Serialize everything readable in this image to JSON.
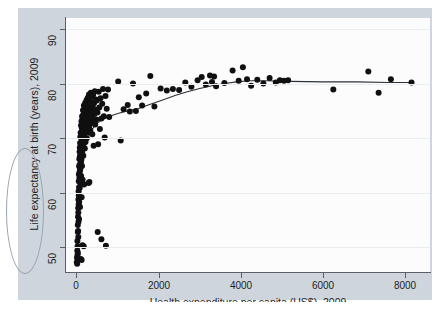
{
  "chart_data": {
    "type": "scatter",
    "title": "",
    "xlabel": "Health expenditure per capita (US$), 2009",
    "ylabel": "Life expectancy at birth (years), 2009",
    "xlim": [
      -250,
      8600
    ],
    "ylim": [
      45.5,
      92
    ],
    "xticks": [
      0,
      2000,
      4000,
      6000,
      8000
    ],
    "xtick_labels": [
      "0",
      "2000",
      "4000",
      "6000",
      "8000"
    ],
    "yticks": [
      50,
      60,
      70,
      80,
      90
    ],
    "ytick_labels": [
      "50",
      "60",
      "70",
      "80",
      "90"
    ],
    "grid": "horizontal",
    "legend": "none",
    "marker_color": "#101010",
    "marker_size": 4.2,
    "fit_line_color": "#2b3138",
    "fit_line_label": "lowess smoothed fit",
    "annotations": [
      {
        "name": "hand-drawn-oval",
        "target": "y-axis-label",
        "color": "#9aa3ad"
      }
    ],
    "points": [
      [
        12,
        47.3
      ],
      [
        18,
        48.1
      ],
      [
        22,
        47.0
      ],
      [
        25,
        49.4
      ],
      [
        28,
        51.2
      ],
      [
        30,
        48.6
      ],
      [
        33,
        50.2
      ],
      [
        36,
        52.8
      ],
      [
        38,
        54.1
      ],
      [
        40,
        49.0
      ],
      [
        42,
        55.6
      ],
      [
        44,
        53.0
      ],
      [
        46,
        57.2
      ],
      [
        48,
        51.9
      ],
      [
        50,
        56.4
      ],
      [
        52,
        58.8
      ],
      [
        54,
        54.7
      ],
      [
        56,
        60.3
      ],
      [
        58,
        57.9
      ],
      [
        60,
        62.1
      ],
      [
        62,
        59.5
      ],
      [
        64,
        63.4
      ],
      [
        66,
        55.2
      ],
      [
        68,
        61.0
      ],
      [
        70,
        64.8
      ],
      [
        72,
        58.3
      ],
      [
        74,
        66.2
      ],
      [
        76,
        62.7
      ],
      [
        78,
        65.1
      ],
      [
        80,
        67.5
      ],
      [
        82,
        60.9
      ],
      [
        84,
        63.9
      ],
      [
        86,
        68.3
      ],
      [
        88,
        66.7
      ],
      [
        90,
        57.4
      ],
      [
        92,
        69.1
      ],
      [
        95,
        64.3
      ],
      [
        98,
        70.2
      ],
      [
        100,
        61.8
      ],
      [
        103,
        67.9
      ],
      [
        106,
        71.0
      ],
      [
        109,
        65.6
      ],
      [
        112,
        68.8
      ],
      [
        115,
        72.3
      ],
      [
        118,
        63.1
      ],
      [
        121,
        70.6
      ],
      [
        124,
        66.1
      ],
      [
        127,
        73.1
      ],
      [
        130,
        59.2
      ],
      [
        133,
        69.7
      ],
      [
        136,
        71.8
      ],
      [
        139,
        64.9
      ],
      [
        142,
        74.0
      ],
      [
        145,
        67.2
      ],
      [
        148,
        72.6
      ],
      [
        151,
        70.9
      ],
      [
        154,
        62.4
      ],
      [
        157,
        73.6
      ],
      [
        160,
        68.5
      ],
      [
        163,
        75.1
      ],
      [
        166,
        71.3
      ],
      [
        170,
        66.8
      ],
      [
        174,
        74.3
      ],
      [
        178,
        69.9
      ],
      [
        182,
        72.9
      ],
      [
        186,
        76.0
      ],
      [
        190,
        61.5
      ],
      [
        194,
        73.9
      ],
      [
        198,
        70.4
      ],
      [
        202,
        75.4
      ],
      [
        206,
        68.1
      ],
      [
        210,
        74.6
      ],
      [
        215,
        72.1
      ],
      [
        220,
        76.5
      ],
      [
        225,
        69.3
      ],
      [
        230,
        73.3
      ],
      [
        235,
        75.8
      ],
      [
        240,
        71.6
      ],
      [
        245,
        74.9
      ],
      [
        250,
        77.0
      ],
      [
        255,
        70.0
      ],
      [
        260,
        73.7
      ],
      [
        265,
        76.2
      ],
      [
        270,
        72.4
      ],
      [
        275,
        75.0
      ],
      [
        280,
        77.4
      ],
      [
        285,
        71.1
      ],
      [
        290,
        74.1
      ],
      [
        295,
        76.8
      ],
      [
        300,
        73.0
      ],
      [
        305,
        75.5
      ],
      [
        310,
        78.0
      ],
      [
        315,
        72.2
      ],
      [
        320,
        74.5
      ],
      [
        325,
        77.2
      ],
      [
        330,
        73.5
      ],
      [
        335,
        75.9
      ],
      [
        340,
        71.4
      ],
      [
        345,
        76.6
      ],
      [
        350,
        74.2
      ],
      [
        355,
        78.3
      ],
      [
        360,
        72.8
      ],
      [
        365,
        75.3
      ],
      [
        370,
        77.6
      ],
      [
        375,
        73.8
      ],
      [
        380,
        76.1
      ],
      [
        385,
        74.8
      ],
      [
        390,
        70.7
      ],
      [
        400,
        75.7
      ],
      [
        410,
        77.9
      ],
      [
        420,
        73.2
      ],
      [
        430,
        76.4
      ],
      [
        440,
        74.4
      ],
      [
        450,
        78.6
      ],
      [
        460,
        72.5
      ],
      [
        470,
        75.2
      ],
      [
        480,
        77.1
      ],
      [
        490,
        73.4
      ],
      [
        500,
        76.9
      ],
      [
        515,
        74.7
      ],
      [
        530,
        68.9
      ],
      [
        545,
        78.5
      ],
      [
        560,
        75.6
      ],
      [
        575,
        71.7
      ],
      [
        590,
        77.3
      ],
      [
        610,
        73.6
      ],
      [
        630,
        76.3
      ],
      [
        650,
        79.0
      ],
      [
        670,
        74.0
      ],
      [
        690,
        70.1
      ],
      [
        710,
        77.7
      ],
      [
        740,
        75.4
      ],
      [
        770,
        78.9
      ],
      [
        800,
        73.9
      ],
      [
        300,
        61.8
      ],
      [
        320,
        62.0
      ],
      [
        420,
        68.6
      ],
      [
        520,
        52.8
      ],
      [
        610,
        51.5
      ],
      [
        720,
        50.3
      ],
      [
        180,
        50.2
      ],
      [
        150,
        50.4
      ],
      [
        130,
        47.7
      ],
      [
        110,
        47.9
      ],
      [
        1020,
        80.4
      ],
      [
        1080,
        69.6
      ],
      [
        1150,
        75.3
      ],
      [
        1250,
        76.1
      ],
      [
        1300,
        74.9
      ],
      [
        1380,
        80.0
      ],
      [
        1450,
        75.0
      ],
      [
        1520,
        77.5
      ],
      [
        1600,
        76.0
      ],
      [
        1700,
        78.2
      ],
      [
        1800,
        81.4
      ],
      [
        1900,
        75.8
      ],
      [
        2050,
        79.1
      ],
      [
        2200,
        78.7
      ],
      [
        2350,
        79.0
      ],
      [
        2500,
        78.8
      ],
      [
        2650,
        80.2
      ],
      [
        2800,
        79.4
      ],
      [
        2950,
        80.6
      ],
      [
        3050,
        81.2
      ],
      [
        3150,
        79.8
      ],
      [
        3250,
        81.5
      ],
      [
        3300,
        80.3
      ],
      [
        3350,
        81.3
      ],
      [
        3400,
        79.5
      ],
      [
        3600,
        80.1
      ],
      [
        3800,
        82.4
      ],
      [
        3950,
        80.5
      ],
      [
        4050,
        83.0
      ],
      [
        4150,
        80.8
      ],
      [
        4250,
        79.6
      ],
      [
        4400,
        80.7
      ],
      [
        4550,
        80.0
      ],
      [
        4700,
        81.0
      ],
      [
        4850,
        80.2
      ],
      [
        4950,
        80.6
      ],
      [
        5050,
        80.5
      ],
      [
        5150,
        80.6
      ],
      [
        6250,
        78.9
      ],
      [
        7100,
        82.2
      ],
      [
        7350,
        78.3
      ],
      [
        7650,
        80.8
      ],
      [
        8150,
        80.2
      ]
    ],
    "fit_curve": [
      [
        10,
        47.8
      ],
      [
        60,
        56.0
      ],
      [
        110,
        62.0
      ],
      [
        160,
        65.8
      ],
      [
        220,
        68.4
      ],
      [
        280,
        70.0
      ],
      [
        350,
        71.2
      ],
      [
        430,
        72.1
      ],
      [
        520,
        72.8
      ],
      [
        620,
        73.3
      ],
      [
        740,
        73.8
      ],
      [
        880,
        74.2
      ],
      [
        1050,
        74.6
      ],
      [
        1250,
        75.0
      ],
      [
        1500,
        75.4
      ],
      [
        1800,
        76.2
      ],
      [
        2100,
        77.0
      ],
      [
        2400,
        77.8
      ],
      [
        2700,
        78.5
      ],
      [
        3000,
        79.1
      ],
      [
        3300,
        79.6
      ],
      [
        3600,
        80.0
      ],
      [
        3900,
        80.3
      ],
      [
        4200,
        80.5
      ],
      [
        4600,
        80.5
      ],
      [
        5200,
        80.4
      ],
      [
        6000,
        80.3
      ],
      [
        6800,
        80.3
      ],
      [
        7600,
        80.2
      ],
      [
        8200,
        80.2
      ]
    ]
  }
}
